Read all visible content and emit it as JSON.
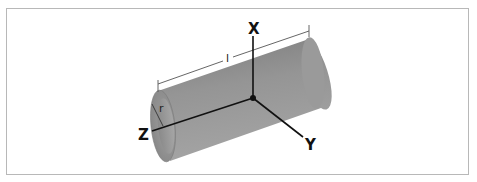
{
  "figure": {
    "type": "cylindrical tube with coordinate axes",
    "labels": {
      "x_axis": "X",
      "y_axis": "Y",
      "z_axis": "Z",
      "length": "l",
      "radius": "r"
    },
    "colors": {
      "tube_body": "#8e8e8e",
      "tube_highlight": "#a8a8a8",
      "tube_inner": "#9a9a9a",
      "axis_line": "#111111",
      "dimension_line": "#555555",
      "frame_border": "#b8b8b8"
    }
  }
}
